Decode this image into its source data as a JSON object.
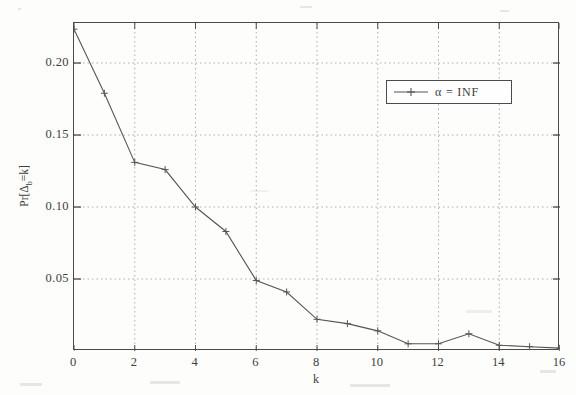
{
  "chart_data": {
    "type": "line",
    "title": "",
    "xlabel": "k",
    "ylabel": "Pr[Δᵦ=k]",
    "ylabel_parts": {
      "prefix": "Pr[Δ",
      "sub": "b",
      "suffix": "=k]"
    },
    "grid": true,
    "xlim": [
      0,
      16
    ],
    "ylim": [
      0,
      0.2278
    ],
    "xticks": [
      0,
      2,
      4,
      6,
      8,
      10,
      12,
      14,
      16
    ],
    "xtick_labels": [
      "0",
      "2",
      "4",
      "6",
      "8",
      "10",
      "12",
      "14",
      "16"
    ],
    "yticks": [
      0.05,
      0.1,
      0.15,
      0.2
    ],
    "ytick_labels": [
      "0.05",
      "0.10",
      "0.15",
      "0.20"
    ],
    "legend_position": "upper right",
    "series": [
      {
        "name": "α = INF",
        "marker": "+",
        "color": "#555555",
        "x": [
          0,
          1,
          2,
          3,
          4,
          5,
          6,
          7,
          8,
          9,
          10,
          11,
          12,
          13,
          14,
          15,
          16
        ],
        "values": [
          0.2235,
          0.179,
          0.131,
          0.126,
          0.1,
          0.083,
          0.049,
          0.041,
          0.022,
          0.019,
          0.014,
          0.005,
          0.005,
          0.012,
          0.004,
          0.003,
          0.002
        ]
      }
    ]
  },
  "legend": {
    "entries": [
      {
        "label": "α = INF",
        "marker": "plus-marker"
      }
    ]
  },
  "axes": {
    "x_title": "k",
    "y_title": "Pr[Δb=k]"
  }
}
